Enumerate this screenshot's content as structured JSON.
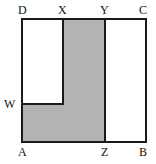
{
  "figure": {
    "type": "geometry-diagram",
    "colors": {
      "stroke": "#1a1a1a",
      "shaded_fill": "#b3b3b3",
      "unshaded_fill": "#ffffff",
      "background": "#ffffff",
      "label_color": "#111111"
    },
    "square": {
      "name": "ABCD",
      "left": 22,
      "right": 146,
      "top": 19,
      "bottom": 142,
      "stroke_width": 2
    },
    "interior_lines": [
      {
        "name": "segment-XZ",
        "orientation": "vertical",
        "x": 63,
        "y1": 19,
        "y2": 104
      },
      {
        "name": "segment-YZ",
        "orientation": "vertical",
        "x": 105,
        "y1": 19,
        "y2": 142
      },
      {
        "name": "segment-WX",
        "orientation": "horizontal",
        "y": 104,
        "x1": 22,
        "x2": 63
      }
    ],
    "shaded_region": {
      "name": "L-shaped-region",
      "vertices": "W-X-Y-Z-A",
      "points": [
        [
          22,
          104
        ],
        [
          63,
          104
        ],
        [
          63,
          19
        ],
        [
          105,
          19
        ],
        [
          105,
          142
        ],
        [
          22,
          142
        ]
      ]
    },
    "labels": [
      {
        "id": "D",
        "text": "D",
        "position": "top-left",
        "x": 18,
        "y": 4
      },
      {
        "id": "X",
        "text": "X",
        "position": "top",
        "x": 58,
        "y": 4
      },
      {
        "id": "Y",
        "text": "Y",
        "position": "top",
        "x": 100,
        "y": 4
      },
      {
        "id": "C",
        "text": "C",
        "position": "top-right",
        "x": 139,
        "y": 4
      },
      {
        "id": "W",
        "text": "W",
        "position": "left",
        "x": 4,
        "y": 98
      },
      {
        "id": "A",
        "text": "A",
        "position": "bottom-left",
        "x": 18,
        "y": 146
      },
      {
        "id": "Z",
        "text": "Z",
        "position": "bottom",
        "x": 101,
        "y": 146
      },
      {
        "id": "B",
        "text": "B",
        "position": "bottom-right",
        "x": 139,
        "y": 146
      }
    ]
  }
}
